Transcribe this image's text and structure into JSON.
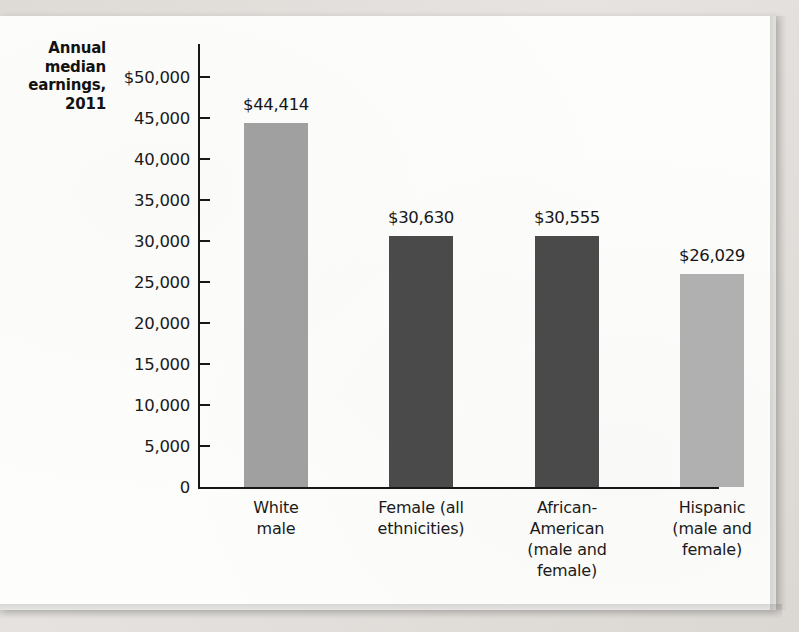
{
  "chart_data": {
    "type": "bar",
    "title": "",
    "ylabel": "Annual median earnings, 2011",
    "xlabel": "",
    "ylim": [
      0,
      50000
    ],
    "ytick_step": 5000,
    "grid": false,
    "legend": "none",
    "categories": [
      "White\nmale",
      "Female (all\nethnicities)",
      "African-\nAmerican\n(male and\nfemale)",
      "Hispanic\n(male and\nfemale)"
    ],
    "values": [
      44414,
      30630,
      30555,
      26029
    ],
    "data_labels": [
      "$44,414",
      "$30,630",
      "$30,555",
      "$26,029"
    ],
    "bar_colors": [
      "#a0a0a0",
      "#4a4a4a",
      "#4a4a4a",
      "#b0b0b0"
    ],
    "ytick_labels": [
      "$50,000",
      "45,000",
      "40,000",
      "35,000",
      "30,000",
      "25,000",
      "20,000",
      "15,000",
      "10,000",
      "5,000",
      "0"
    ],
    "ytick_values": [
      50000,
      45000,
      40000,
      35000,
      30000,
      25000,
      20000,
      15000,
      10000,
      5000,
      0
    ]
  },
  "axis": {
    "y_title_line1": "Annual",
    "y_title_line2": "median",
    "y_title_line3": "earnings,",
    "y_title_line4": "2011"
  },
  "categories": [
    {
      "line1": "White",
      "line2": "male",
      "line3": "",
      "line4": ""
    },
    {
      "line1": "Female (all",
      "line2": "ethnicities)",
      "line3": "",
      "line4": ""
    },
    {
      "line1": "African-",
      "line2": "American",
      "line3": "(male and",
      "line4": "female)"
    },
    {
      "line1": "Hispanic",
      "line2": "(male and",
      "line3": "female)",
      "line4": ""
    }
  ]
}
